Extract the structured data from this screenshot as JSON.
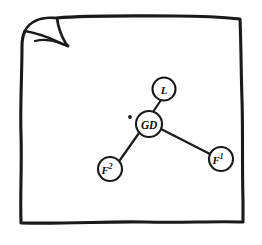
{
  "figure": {
    "background_color": "#ffffff",
    "ink_color": "#1a1a1a",
    "page": {
      "name": "sketch-page",
      "corner_fold": "top-left",
      "border_style": "hand-drawn wavy rectangle"
    }
  },
  "graph": {
    "type": "node-link-star",
    "center_node_id": "GD",
    "nodes": [
      {
        "id": "GD",
        "label": "GD",
        "sup": "",
        "x": 149,
        "y": 124,
        "r": 13
      },
      {
        "id": "L",
        "label": "L",
        "sup": "",
        "x": 164,
        "y": 89,
        "r": 11.5
      },
      {
        "id": "F2",
        "label": "F",
        "sup": "2",
        "x": 110,
        "y": 169,
        "r": 12
      },
      {
        "id": "F1",
        "label": "F",
        "sup": "1",
        "x": 221,
        "y": 159,
        "r": 12
      }
    ],
    "edges": [
      {
        "from": "GD",
        "to": "L"
      },
      {
        "from": "GD",
        "to": "F2"
      },
      {
        "from": "GD",
        "to": "F1"
      }
    ],
    "marker_dot": {
      "name": "center-dot-marker",
      "x": 130,
      "y": 117,
      "r": 1.9
    }
  }
}
